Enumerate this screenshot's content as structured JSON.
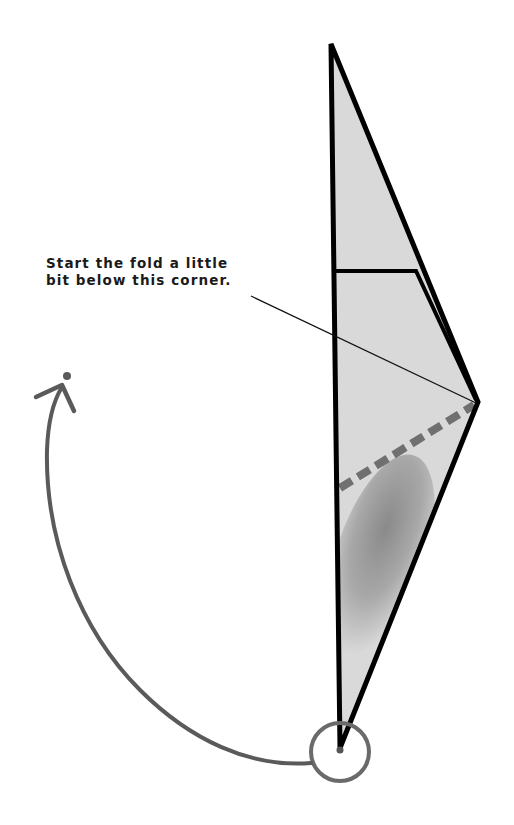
{
  "instruction": {
    "line1": "Start the fold a little",
    "line2": "bit below this corner."
  },
  "diagram": {
    "type": "origami-fold-step",
    "paper": {
      "fill": "#d9d9d9",
      "outline": "#000000",
      "vertices": {
        "top": [
          331,
          44
        ],
        "right": [
          478,
          402
        ],
        "bottom": [
          340,
          748
        ]
      }
    },
    "inner_flap_edge": {
      "from": [
        334,
        271
      ],
      "corner": [
        416,
        271
      ],
      "to": [
        476,
        400
      ]
    },
    "fold_line": {
      "style": "dashed",
      "color": "#707070",
      "from": [
        340,
        488
      ],
      "to": [
        474,
        405
      ]
    },
    "leader_line": {
      "from": [
        251,
        296
      ],
      "to": [
        476,
        403
      ]
    },
    "shadow_color": "#8a8a8a",
    "rotation_arrow": {
      "color": "#5a5a5a",
      "direction": "counter-clockwise, from bottom point up to top-left"
    },
    "pivot_circle": {
      "center": [
        340,
        752
      ],
      "radius": 29,
      "color": "#6a6a6a"
    }
  }
}
